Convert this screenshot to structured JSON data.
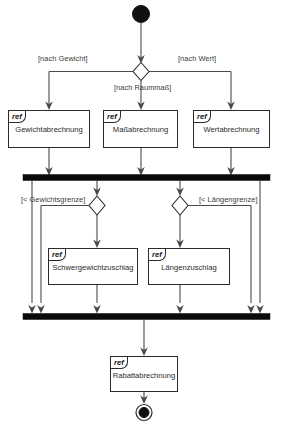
{
  "diagram": {
    "type": "uml-activity-diagram",
    "width": 284,
    "height": 437,
    "background_color": "#ffffff",
    "line_color": "#4a4a4a",
    "bar_color": "#0a0a0a",
    "node_border_color": "#2b2b2b"
  },
  "nodes": {
    "start": {
      "name": "initial-node"
    },
    "end": {
      "name": "final-node"
    },
    "decision_1": {
      "name": "decision-abrechnungsart"
    },
    "decision_2": {
      "name": "decision-gewichtsgrenze"
    },
    "decision_3": {
      "name": "decision-laengengrenze"
    },
    "fork_bar": {
      "name": "fork-bar"
    },
    "join_bar": {
      "name": "join-bar"
    }
  },
  "refs": [
    {
      "tag": "ref",
      "title": "Gewichtabrechnung"
    },
    {
      "tag": "ref",
      "title": "Maßabrechnung"
    },
    {
      "tag": "ref",
      "title": "Wertabrechnung"
    },
    {
      "tag": "ref",
      "title": "Schwergewichtzuschlag"
    },
    {
      "tag": "ref",
      "title": "Längenzuschlag"
    },
    {
      "tag": "ref",
      "title": "Rabattabrechnung"
    }
  ],
  "guards": [
    {
      "text": "[nach Gewicht]"
    },
    {
      "text": "[nach Raummaß]"
    },
    {
      "text": "[nach Wert]"
    },
    {
      "text": "[< Gewichtsgrenze]"
    },
    {
      "text": "[< Längengrenze]"
    }
  ]
}
